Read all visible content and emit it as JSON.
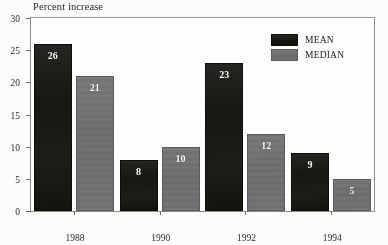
{
  "chart_data": {
    "type": "bar",
    "title": "Percent increase",
    "xlabel": "",
    "ylabel": "",
    "categories": [
      "1988",
      "1990",
      "1992",
      "1994"
    ],
    "series": [
      {
        "name": "MEAN",
        "color": "#15140f",
        "values": [
          26,
          8,
          23,
          9
        ]
      },
      {
        "name": "MEDIAN",
        "color": "#6d6d6d",
        "values": [
          21,
          10,
          12,
          5
        ]
      }
    ],
    "ylim": [
      0,
      30
    ],
    "yticks": [
      0,
      5,
      10,
      15,
      20,
      25,
      30
    ],
    "ytick_labels": [
      "0",
      "5",
      "10",
      "15",
      "20",
      "25",
      "30"
    ],
    "grid": false,
    "legend_position": "top-right",
    "data_labels": true
  },
  "legend": {
    "items": [
      {
        "label": "MEAN",
        "swatch": "mean-swatch"
      },
      {
        "label": "MEDIAN",
        "swatch": "median-swatch"
      }
    ]
  },
  "bars": [
    {
      "group": "1988",
      "series": "MEAN",
      "value": "26"
    },
    {
      "group": "1988",
      "series": "MEDIAN",
      "value": "21"
    },
    {
      "group": "1990",
      "series": "MEAN",
      "value": "8"
    },
    {
      "group": "1990",
      "series": "MEDIAN",
      "value": "10"
    },
    {
      "group": "1992",
      "series": "MEAN",
      "value": "23"
    },
    {
      "group": "1992",
      "series": "MEDIAN",
      "value": "12"
    },
    {
      "group": "1994",
      "series": "MEAN",
      "value": "9"
    },
    {
      "group": "1994",
      "series": "MEDIAN",
      "value": "5"
    }
  ]
}
